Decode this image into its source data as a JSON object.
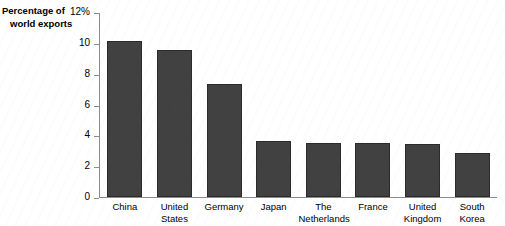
{
  "chart_data": {
    "type": "bar",
    "title": "",
    "ylabel": "Percentage of world exports",
    "xlabel": "",
    "categories": [
      "China",
      "United States",
      "Germany",
      "Japan",
      "The Netherlands",
      "France",
      "United Kingdom",
      "South Korea"
    ],
    "values": [
      10.2,
      9.6,
      7.4,
      3.65,
      3.55,
      3.5,
      3.45,
      2.85
    ],
    "ylim": [
      0,
      12
    ],
    "yticks": [
      0,
      2,
      4,
      6,
      8,
      10,
      12
    ],
    "ytick_labels": [
      "0",
      "2",
      "4",
      "6",
      "8",
      "10",
      "12%"
    ],
    "grid": false,
    "legend": "none",
    "bar_color": "#414141",
    "bar_edge_color": "#2b2b2b",
    "axis_color": "#8c8c8c"
  },
  "axis_title": {
    "line1": "Percentage of",
    "line2": "world exports"
  },
  "x_labels": [
    {
      "line1": "China",
      "line2": ""
    },
    {
      "line1": "United",
      "line2": "States"
    },
    {
      "line1": "Germany",
      "line2": ""
    },
    {
      "line1": "Japan",
      "line2": ""
    },
    {
      "line1": "The",
      "line2": "Netherlands"
    },
    {
      "line1": "France",
      "line2": ""
    },
    {
      "line1": "United",
      "line2": "Kingdom"
    },
    {
      "line1": "South",
      "line2": "Korea"
    }
  ]
}
